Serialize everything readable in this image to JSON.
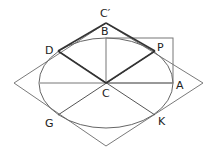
{
  "diagram": {
    "labels": {
      "C_prime": "C′",
      "B": "B",
      "D": "D",
      "P": "P",
      "A": "A",
      "C": "C",
      "G": "G",
      "K": "K"
    },
    "colors": {
      "thin_line": "#777777",
      "thick_line": "#333333",
      "label": "#222222"
    }
  }
}
